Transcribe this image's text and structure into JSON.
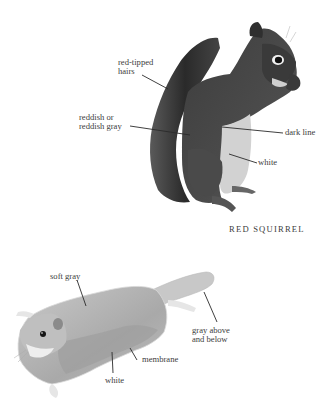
{
  "figures": [
    {
      "name": "red-squirrel",
      "caption": "RED SQUIRREL",
      "labels": {
        "red_tipped_l1": "red-tipped",
        "red_tipped_l2": "hairs",
        "reddish_l1": "reddish or",
        "reddish_l2": "reddish gray",
        "dark_line": "dark line",
        "white": "white"
      }
    },
    {
      "name": "flying-squirrel",
      "caption": "",
      "labels": {
        "soft_gray": "soft gray",
        "gray_above_l1": "gray above",
        "gray_above_l2": "and below",
        "membrane": "membrane",
        "white": "white"
      }
    }
  ]
}
